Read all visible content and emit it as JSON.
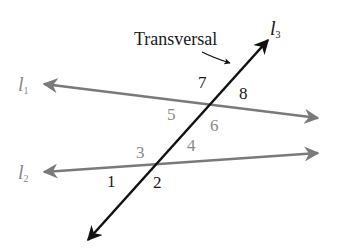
{
  "diagram": {
    "callout": "Transversal",
    "lines": [
      {
        "name": "l",
        "sub": "1",
        "color": "#7a7a7a"
      },
      {
        "name": "l",
        "sub": "2",
        "color": "#7a7a7a"
      },
      {
        "name": "l",
        "sub": "3",
        "color": "#111111"
      }
    ],
    "angles": [
      "1",
      "2",
      "3",
      "4",
      "5",
      "6",
      "7",
      "8"
    ]
  }
}
